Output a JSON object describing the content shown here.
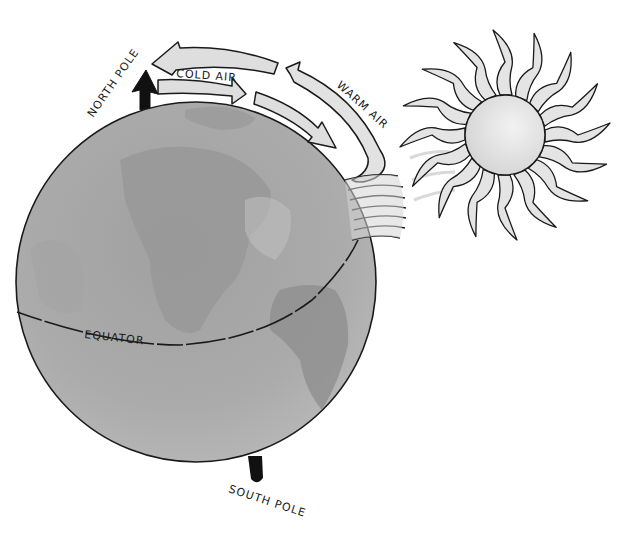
{
  "diagram": {
    "type": "illustration",
    "labels": {
      "north_pole": "NORTH POLE",
      "south_pole": "SOUTH POLE",
      "equator": "EQUATOR",
      "cold_air": "COLD AIR",
      "warm_air": "WARM AIR"
    },
    "colors": {
      "globe_fill": "#a9a9a9",
      "globe_land": "#959595",
      "arrow_fill": "#dcdcdc",
      "sun_fill": "#e6e6e6",
      "outline": "#1a1a1a",
      "background": "#ffffff"
    },
    "elements": [
      {
        "name": "globe",
        "center": [
          196,
          282
        ],
        "radius": 180
      },
      {
        "name": "sun",
        "center": [
          505,
          135
        ],
        "radius": 40,
        "rays": 16
      },
      {
        "name": "north-pole-axis-arrow"
      },
      {
        "name": "south-pole-axis-stub"
      },
      {
        "name": "cold-air-arrows",
        "direction": "poleward-to-equator"
      },
      {
        "name": "warm-air-arrow",
        "direction": "equator-to-pole"
      },
      {
        "name": "equator-line"
      }
    ]
  }
}
